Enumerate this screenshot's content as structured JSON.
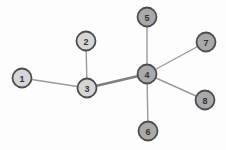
{
  "diagram": {
    "background": "#fdfdfd",
    "node_style": {
      "radius": 9.5,
      "stroke_color": "#4d4d4d",
      "stroke_width": 1.8,
      "label_color": "#333333",
      "label_font_size": 9,
      "fill_light": "#d6d6d6",
      "fill_dark": "#a9a9a9"
    },
    "edge_style": {
      "color": "#9a9a9a",
      "width": 1.4,
      "thick_color": "#7f7f7f",
      "thick_width": 2.6
    },
    "nodes": [
      {
        "id": "1",
        "label": "1",
        "x": 22,
        "y": 78,
        "shade": "light"
      },
      {
        "id": "2",
        "label": "2",
        "x": 86,
        "y": 41,
        "shade": "light"
      },
      {
        "id": "3",
        "label": "3",
        "x": 87,
        "y": 88,
        "shade": "light"
      },
      {
        "id": "4",
        "label": "4",
        "x": 147,
        "y": 74,
        "shade": "dark"
      },
      {
        "id": "5",
        "label": "5",
        "x": 147,
        "y": 17,
        "shade": "dark"
      },
      {
        "id": "6",
        "label": "6",
        "x": 148,
        "y": 131,
        "shade": "dark"
      },
      {
        "id": "7",
        "label": "7",
        "x": 206,
        "y": 42,
        "shade": "dark"
      },
      {
        "id": "8",
        "label": "8",
        "x": 205,
        "y": 100,
        "shade": "dark"
      }
    ],
    "edges": [
      {
        "from": "1",
        "to": "3",
        "thick": false
      },
      {
        "from": "2",
        "to": "3",
        "thick": false
      },
      {
        "from": "3",
        "to": "4",
        "thick": true
      },
      {
        "from": "4",
        "to": "5",
        "thick": false
      },
      {
        "from": "4",
        "to": "6",
        "thick": false
      },
      {
        "from": "4",
        "to": "7",
        "thick": false
      },
      {
        "from": "4",
        "to": "8",
        "thick": false
      }
    ]
  }
}
